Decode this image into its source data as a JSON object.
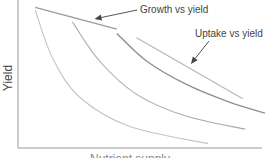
{
  "chart_data": {
    "type": "line",
    "title": "",
    "xlabel": "Nutrient supply",
    "ylabel": "Yield",
    "grid": false,
    "x_ticks": [],
    "y_ticks": [],
    "xlim": [
      0,
      1
    ],
    "ylim": [
      0,
      1
    ],
    "series": [
      {
        "name": "curve-1",
        "color": "#c4c4c4",
        "points": [
          [
            0.07,
            0.95
          ],
          [
            0.14,
            0.62
          ],
          [
            0.25,
            0.35
          ],
          [
            0.45,
            0.15
          ],
          [
            0.77,
            0.03
          ]
        ]
      },
      {
        "name": "curve-2",
        "color": "#a9a9a9",
        "points": [
          [
            0.22,
            0.87
          ],
          [
            0.33,
            0.6
          ],
          [
            0.48,
            0.37
          ],
          [
            0.68,
            0.22
          ],
          [
            0.92,
            0.13
          ]
        ]
      },
      {
        "name": "curve-3",
        "color": "#8f8f8f",
        "points": [
          [
            0.4,
            0.79
          ],
          [
            0.52,
            0.6
          ],
          [
            0.68,
            0.44
          ],
          [
            0.85,
            0.32
          ],
          [
            1.0,
            0.24
          ]
        ]
      },
      {
        "name": "Growth vs yield",
        "color": "#999999",
        "points": [
          [
            0.07,
            0.97
          ],
          [
            0.4,
            0.82
          ]
        ]
      },
      {
        "name": "Uptake vs yield",
        "color": "#b5b5b5",
        "points": [
          [
            0.48,
            0.76
          ],
          [
            0.91,
            0.34
          ]
        ]
      }
    ],
    "annotations": [
      {
        "text": "Growth vs yield",
        "target_series": "Growth vs yield",
        "target": [
          0.31,
          0.89
        ]
      },
      {
        "text": "Uptake vs yield",
        "target_series": "Uptake vs yield",
        "target": [
          0.7,
          0.58
        ]
      }
    ]
  }
}
